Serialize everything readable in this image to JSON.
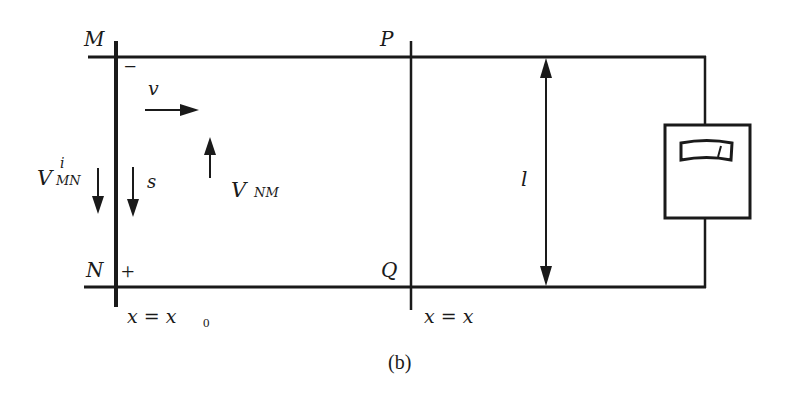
{
  "figure": {
    "caption": "(b)",
    "colors": {
      "ink": "#1a1a1a",
      "background": "#ffffff"
    }
  },
  "rails": {
    "top": "top-rail",
    "bottom": "bottom-rail"
  },
  "rod_left": {
    "top_label": "M",
    "bottom_label": "N",
    "top_sign": "−",
    "bottom_sign": "+",
    "position_label": "x = x",
    "position_subscript": "0"
  },
  "rod_right": {
    "top_label": "P",
    "bottom_label": "Q",
    "position_label": "x = x"
  },
  "annotations": {
    "velocity": "v",
    "s_label": "s",
    "v_mn_main": "V",
    "v_mn_sup": "i",
    "v_mn_sub": "MN",
    "v_nm_main": "V",
    "v_nm_sub": "NM",
    "length": "l"
  },
  "meter": {
    "icon": "voltmeter-icon"
  }
}
